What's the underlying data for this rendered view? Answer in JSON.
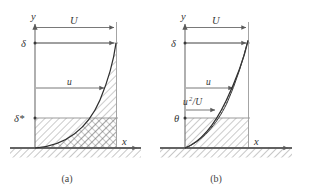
{
  "figure": {
    "background": "#ffffff",
    "line_color": "#6e6e6e",
    "curve_color": "#2f2f2f",
    "label_color": "#333333",
    "width": 311,
    "height": 190
  },
  "panel_a": {
    "caption": "(a)",
    "axis_y_label": "y",
    "axis_x_label": "x",
    "labels": {
      "free_stream": "U",
      "delta": "δ",
      "velocity": "u",
      "delta_star": "δ*"
    },
    "hatch_regions": [
      {
        "name": "deficit-area-above-curve",
        "pattern": "diagonal-45"
      },
      {
        "name": "displacement-rectangle",
        "pattern": "diagonal-45"
      },
      {
        "name": "equal-area-crosshatch",
        "pattern": "cross-hatch"
      }
    ],
    "arrows": [
      {
        "name": "U-arrow",
        "label": "U"
      },
      {
        "name": "delta-arrow",
        "label": "δ"
      },
      {
        "name": "u-arrow",
        "label": "u"
      }
    ]
  },
  "panel_b": {
    "caption": "(b)",
    "axis_y_label": "y",
    "axis_x_label": "x",
    "labels": {
      "free_stream": "U",
      "delta": "δ",
      "velocity": "u",
      "momentum_flux": "u²/U",
      "theta": "θ"
    },
    "momentum_flux_base": "u",
    "momentum_flux_exp": "2",
    "momentum_flux_den": "/U",
    "hatch_regions": [
      {
        "name": "momentum-deficit-lens",
        "pattern": "horizontal"
      },
      {
        "name": "theta-rectangle",
        "pattern": "diagonal-45"
      },
      {
        "name": "equal-area-crosshatch",
        "pattern": "cross-hatch"
      }
    ],
    "arrows": [
      {
        "name": "U-arrow",
        "label": "U"
      },
      {
        "name": "delta-arrow",
        "label": "δ"
      },
      {
        "name": "u-arrow",
        "label": "u"
      },
      {
        "name": "u2U-arrow",
        "label": "u²/U"
      }
    ]
  },
  "ground": {
    "name": "wall-surface",
    "pattern": "diagonal-45"
  }
}
